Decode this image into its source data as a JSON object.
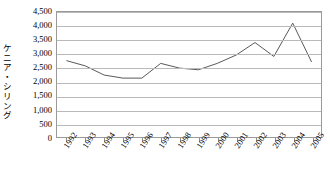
{
  "chart_data": {
    "type": "line",
    "title": "",
    "subtitle": "",
    "xlabel": "",
    "ylabel": "ケニア・シリング",
    "ylabel_chars": [
      "ケ",
      "ニ",
      "ア",
      "・",
      "シ",
      "リ",
      "ン",
      "グ"
    ],
    "categories": [
      "1992",
      "1993",
      "1994",
      "1995",
      "1996",
      "1997",
      "1998",
      "1999",
      "2000",
      "2001",
      "2002",
      "2003",
      "2004",
      "2005"
    ],
    "x": [
      1992,
      1993,
      1994,
      1995,
      1996,
      1997,
      1998,
      1999,
      2000,
      2001,
      2002,
      2003,
      2004,
      2005
    ],
    "values": [
      2750,
      2560,
      2230,
      2120,
      2120,
      2650,
      2480,
      2420,
      2650,
      2950,
      3400,
      2900,
      4100,
      2700
    ],
    "ylim": [
      0,
      4500
    ],
    "ytick_values": [
      0,
      500,
      1000,
      1500,
      2000,
      2500,
      3000,
      3500,
      4000,
      4500
    ],
    "ytick_labels": [
      "0",
      "500",
      "1,000",
      "1,500",
      "2,000",
      "2,500",
      "3,000",
      "3,500",
      "4,000",
      "4,500"
    ],
    "grid": true,
    "grid_axis": "y",
    "legend": false,
    "legend_position": "none",
    "series": [
      {
        "name": "ケニア・シリング",
        "values": [
          2750,
          2560,
          2230,
          2120,
          2120,
          2650,
          2480,
          2420,
          2650,
          2950,
          3400,
          2900,
          4100,
          2700
        ],
        "color": "#595959",
        "line_width": 1,
        "markers": false
      }
    ],
    "colors": {
      "line": "#595959",
      "grid": "#b9b9b9",
      "frame": "#9a9a9a",
      "text": "#000000",
      "background": "#ffffff"
    }
  }
}
